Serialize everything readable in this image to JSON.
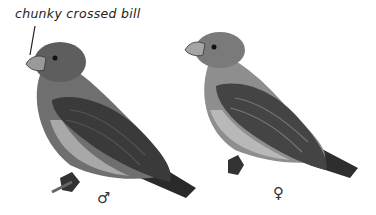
{
  "annotation": {
    "text": "chunky crossed bill"
  },
  "figures": [
    {
      "subject": "male crossbill",
      "sex_symbol": "♂"
    },
    {
      "subject": "female crossbill",
      "sex_symbol": "♀"
    }
  ],
  "colors": {
    "background": "#ffffff",
    "ink": "#222222"
  }
}
